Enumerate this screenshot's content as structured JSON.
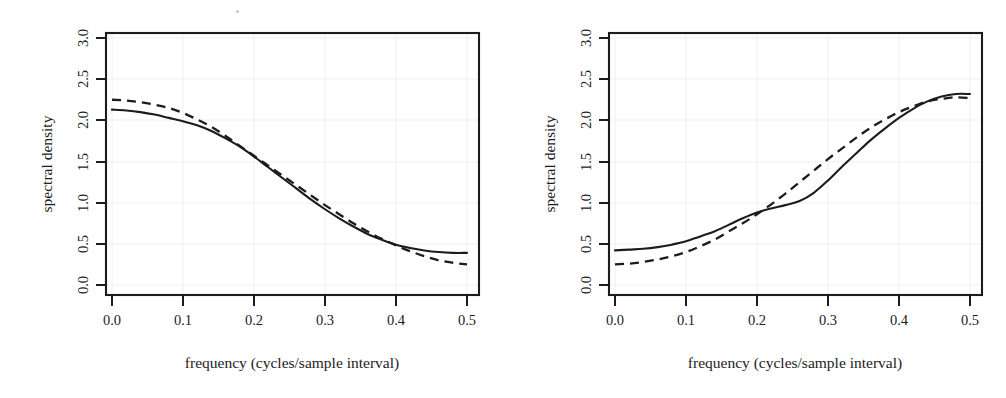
{
  "figure": {
    "background": "#ffffff",
    "ink_color": "#1c1c1c",
    "grid_color": "#efefef",
    "panel_count": 2
  },
  "chart_data": [
    {
      "id": "left",
      "type": "line",
      "title": "",
      "xlabel": "frequency (cycles/sample interval)",
      "ylabel": "spectral density",
      "xlim": [
        0.0,
        0.5
      ],
      "ylim": [
        0.0,
        3.0
      ],
      "xticks": [
        0.0,
        0.1,
        0.2,
        0.3,
        0.4,
        0.5
      ],
      "xtick_labels": [
        "0.0",
        "0.1",
        "0.2",
        "0.3",
        "0.4",
        "0.5"
      ],
      "yticks": [
        0.0,
        0.5,
        1.0,
        1.5,
        2.0,
        2.5,
        3.0
      ],
      "ytick_labels": [
        "0.0",
        "0.5",
        "1.0",
        "1.5",
        "2.0",
        "2.5",
        "3.0"
      ],
      "grid": true,
      "legend": "none",
      "x": [
        0.0,
        0.02,
        0.04,
        0.06,
        0.08,
        0.1,
        0.12,
        0.14,
        0.16,
        0.18,
        0.2,
        0.22,
        0.24,
        0.26,
        0.28,
        0.3,
        0.32,
        0.34,
        0.36,
        0.38,
        0.4,
        0.42,
        0.44,
        0.46,
        0.48,
        0.5
      ],
      "series": [
        {
          "name": "solid",
          "style": "solid",
          "values": [
            2.13,
            2.12,
            2.1,
            2.07,
            2.03,
            1.99,
            1.94,
            1.87,
            1.78,
            1.68,
            1.56,
            1.43,
            1.3,
            1.17,
            1.04,
            0.92,
            0.81,
            0.71,
            0.62,
            0.55,
            0.49,
            0.45,
            0.42,
            0.4,
            0.39,
            0.39
          ]
        },
        {
          "name": "dashed",
          "style": "dashed",
          "values": [
            2.25,
            2.24,
            2.22,
            2.19,
            2.15,
            2.09,
            2.01,
            1.92,
            1.81,
            1.69,
            1.57,
            1.45,
            1.33,
            1.21,
            1.09,
            0.97,
            0.86,
            0.75,
            0.65,
            0.56,
            0.48,
            0.41,
            0.35,
            0.3,
            0.27,
            0.25
          ]
        }
      ]
    },
    {
      "id": "right",
      "type": "line",
      "title": "",
      "xlabel": "frequency (cycles/sample interval)",
      "ylabel": "spectral density",
      "xlim": [
        0.0,
        0.5
      ],
      "ylim": [
        0.0,
        3.0
      ],
      "xticks": [
        0.0,
        0.1,
        0.2,
        0.3,
        0.4,
        0.5
      ],
      "xtick_labels": [
        "0.0",
        "0.1",
        "0.2",
        "0.3",
        "0.4",
        "0.5"
      ],
      "yticks": [
        0.0,
        0.5,
        1.0,
        1.5,
        2.0,
        2.5,
        3.0
      ],
      "ytick_labels": [
        "0.0",
        "0.5",
        "1.0",
        "1.5",
        "2.0",
        "2.5",
        "3.0"
      ],
      "grid": true,
      "legend": "none",
      "x": [
        0.0,
        0.02,
        0.04,
        0.06,
        0.08,
        0.1,
        0.12,
        0.14,
        0.16,
        0.18,
        0.2,
        0.22,
        0.24,
        0.26,
        0.28,
        0.3,
        0.32,
        0.34,
        0.36,
        0.38,
        0.4,
        0.42,
        0.44,
        0.46,
        0.48,
        0.5
      ],
      "series": [
        {
          "name": "solid",
          "style": "solid",
          "values": [
            0.42,
            0.43,
            0.44,
            0.46,
            0.49,
            0.53,
            0.59,
            0.65,
            0.73,
            0.81,
            0.88,
            0.93,
            0.97,
            1.02,
            1.12,
            1.27,
            1.44,
            1.6,
            1.76,
            1.9,
            2.03,
            2.14,
            2.23,
            2.29,
            2.32,
            2.32
          ]
        },
        {
          "name": "dashed",
          "style": "dashed",
          "values": [
            0.25,
            0.26,
            0.28,
            0.31,
            0.35,
            0.4,
            0.47,
            0.55,
            0.65,
            0.75,
            0.86,
            0.98,
            1.11,
            1.25,
            1.39,
            1.53,
            1.66,
            1.79,
            1.91,
            2.01,
            2.1,
            2.17,
            2.23,
            2.26,
            2.28,
            2.27
          ]
        }
      ]
    }
  ]
}
